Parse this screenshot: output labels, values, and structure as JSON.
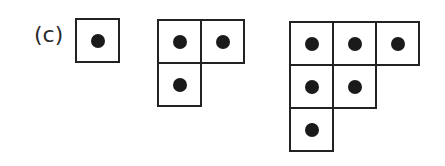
{
  "label": "(c)",
  "cell_size": 45,
  "figures": [
    {
      "name": "figure-1",
      "left": 75,
      "top": 18,
      "cells": [
        [
          0,
          0
        ]
      ]
    },
    {
      "name": "figure-2",
      "left": 157,
      "top": 19,
      "cells": [
        [
          0,
          0
        ],
        [
          0,
          1
        ],
        [
          1,
          0
        ]
      ]
    },
    {
      "name": "figure-3",
      "left": 289,
      "top": 21,
      "cells": [
        [
          0,
          0
        ],
        [
          0,
          1
        ],
        [
          0,
          2
        ],
        [
          1,
          0
        ],
        [
          1,
          1
        ],
        [
          2,
          0
        ]
      ]
    }
  ],
  "colors": {
    "stroke": "#222222",
    "dot": "#1a1a1a",
    "background": "#ffffff"
  }
}
